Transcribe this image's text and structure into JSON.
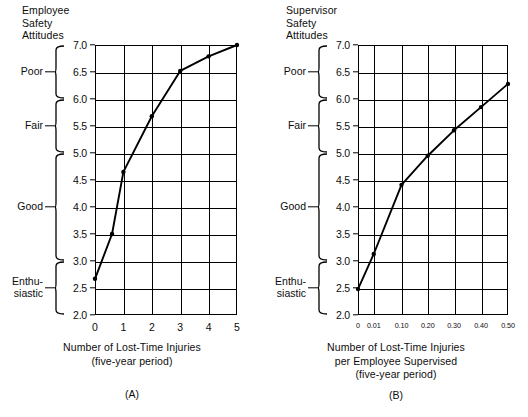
{
  "chart_data": [
    {
      "id": "A",
      "type": "line",
      "title": "Employee\nSafety\nAttitudes",
      "panel_letter": "(A)",
      "xlabel": "Number of Lost-Time Injuries\n(five-year period)",
      "ylabel": "Employee Safety Attitudes",
      "grid": true,
      "legend": "none",
      "xlim": [
        0,
        5
      ],
      "ylim": [
        2.0,
        7.0
      ],
      "xticks": [
        "0",
        "1",
        "2",
        "3",
        "4",
        "5"
      ],
      "xtick_values": [
        0,
        1,
        2,
        3,
        4,
        5
      ],
      "yticks": [
        "2.0",
        "2.5",
        "3.0",
        "3.5",
        "4.0",
        "4.5",
        "5.0",
        "5.5",
        "6.0",
        "6.5",
        "7.0"
      ],
      "ytick_values": [
        2.0,
        2.5,
        3.0,
        3.5,
        4.0,
        4.5,
        5.0,
        5.5,
        6.0,
        6.5,
        7.0
      ],
      "x": [
        0,
        0.6,
        1.0,
        2.0,
        3.0,
        4.0,
        5.0
      ],
      "values": [
        2.67,
        3.5,
        4.65,
        5.68,
        6.52,
        6.79,
        7.0
      ],
      "categories_axis": [
        {
          "label": "Poor",
          "from": 6.0,
          "to": 7.0,
          "tick_at": 6.5
        },
        {
          "label": "Fair",
          "from": 5.0,
          "to": 6.0,
          "tick_at": 5.5
        },
        {
          "label": "Good",
          "from": 3.0,
          "to": 5.0,
          "tick_at": 4.0
        },
        {
          "label": "Enthu-\nsiastic",
          "from": 2.0,
          "to": 3.0,
          "tick_at": 2.5
        }
      ]
    },
    {
      "id": "B",
      "type": "line",
      "title": "Supervisor\nSafety\nAttitudes",
      "panel_letter": "(B)",
      "xlabel": "Number of Lost-Time Injuries\nper Employee Supervised\n(five-year period)",
      "ylabel": "Supervisor Safety Attitudes",
      "grid": true,
      "legend": "none",
      "ylim": [
        2.0,
        7.0
      ],
      "xticks": [
        "0",
        "0.01",
        "0.10",
        "0.20",
        "0.30",
        "0.40",
        "0.50"
      ],
      "xtick_values": [
        0,
        0.01,
        0.1,
        0.2,
        0.3,
        0.4,
        0.5
      ],
      "xtick_positions": [
        0,
        0.105,
        0.29,
        0.465,
        0.64,
        0.82,
        1.0
      ],
      "yticks": [
        "2.0",
        "2.5",
        "3.0",
        "3.5",
        "4.0",
        "4.5",
        "5.0",
        "5.5",
        "6.0",
        "6.5",
        "7.0"
      ],
      "ytick_values": [
        2.0,
        2.5,
        3.0,
        3.5,
        4.0,
        4.5,
        5.0,
        5.5,
        6.0,
        6.5,
        7.0
      ],
      "x": [
        0,
        0.01,
        0.1,
        0.2,
        0.3,
        0.4,
        0.5
      ],
      "values": [
        2.48,
        3.13,
        4.41,
        4.95,
        5.42,
        5.85,
        6.28
      ],
      "categories_axis": [
        {
          "label": "Poor",
          "from": 6.0,
          "to": 7.0,
          "tick_at": 6.5
        },
        {
          "label": "Fair",
          "from": 5.0,
          "to": 6.0,
          "tick_at": 5.5
        },
        {
          "label": "Good",
          "from": 3.0,
          "to": 5.0,
          "tick_at": 4.0
        },
        {
          "label": "Enthu-\nsiastic",
          "from": 2.0,
          "to": 3.0,
          "tick_at": 2.5
        }
      ]
    }
  ]
}
